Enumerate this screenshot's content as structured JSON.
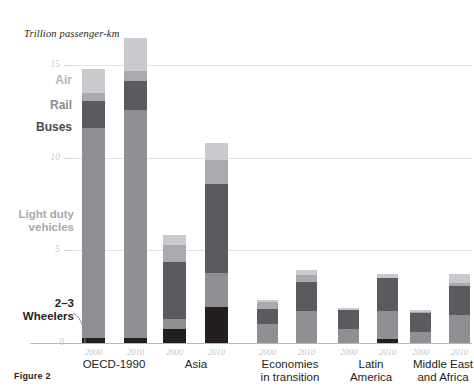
{
  "figure": {
    "caption": "Figure 2",
    "top_cut_text": "",
    "axis_title": "Trillion passenger-km"
  },
  "colors": {
    "wheelers": "#231f20",
    "light_duty_vehicles": "#8f9094",
    "buses": "#5a5b5f",
    "rail": "#a9aaae",
    "air": "#c9cacd",
    "gridline": "#e2e2e6",
    "baseline": "#b9b9bd",
    "tick_text": "#c9c9cc",
    "label_text": "#231f20"
  },
  "legend": {
    "items": [
      {
        "key": "air",
        "label": "Air"
      },
      {
        "key": "rail",
        "label": "Rail"
      },
      {
        "key": "buses",
        "label": "Buses"
      },
      {
        "key": "light_duty_vehicles",
        "label": "Light duty\nvehicles"
      },
      {
        "key": "wheelers",
        "label": "2–3\nWheelers"
      }
    ],
    "air_label": "Air",
    "rail_label": "Rail",
    "buses_label": "Buses",
    "ldv_line1": "Light duty",
    "ldv_line2": "vehicles",
    "wheelers_line1": "2–3",
    "wheelers_line2": "Wheelers"
  },
  "chart_data": {
    "type": "bar",
    "title": "",
    "subtitle": "",
    "xlabel": "",
    "ylabel": "Trillion passenger-km",
    "ylim": [
      0,
      16.5
    ],
    "yticks": [
      0,
      5,
      10,
      15
    ],
    "ytick_labels": [
      "0",
      "5",
      "10",
      "15"
    ],
    "grid": true,
    "stacked": true,
    "legend_position": "left-inline",
    "categories": [
      "OECD-1990",
      "Asia",
      "Economies in transition",
      "Latin America",
      "Middle East and Africa"
    ],
    "category_labels": [
      [
        "OECD-1990"
      ],
      [
        "Asia"
      ],
      [
        "Economies",
        "in transition"
      ],
      [
        "Latin",
        "America"
      ],
      [
        "Middle East",
        "and Africa"
      ]
    ],
    "years": [
      "2000",
      "2010"
    ],
    "series": [
      {
        "name": "2–3 Wheelers",
        "color": "#231f20",
        "values": [
          {
            "group": "OECD-1990",
            "2000": 0.25,
            "2010": 0.25
          },
          {
            "group": "Asia",
            "2000": 0.75,
            "2010": 1.95
          },
          {
            "group": "Economies in transition",
            "2000": 0.0,
            "2010": 0.0
          },
          {
            "group": "Latin America",
            "2000": 0.0,
            "2010": 0.2
          },
          {
            "group": "Middle East and Africa",
            "2000": 0.0,
            "2010": 0.0
          }
        ]
      },
      {
        "name": "Light duty vehicles",
        "color": "#8f9094",
        "values": [
          {
            "group": "OECD-1990",
            "2000": 11.35,
            "2010": 12.3
          },
          {
            "group": "Asia",
            "2000": 0.55,
            "2010": 1.85
          },
          {
            "group": "Economies in transition",
            "2000": 1.0,
            "2010": 1.75
          },
          {
            "group": "Latin America",
            "2000": 0.75,
            "2010": 1.55
          },
          {
            "group": "Middle East and Africa",
            "2000": 0.6,
            "2010": 1.5
          }
        ]
      },
      {
        "name": "Buses",
        "color": "#5a5b5f",
        "values": [
          {
            "group": "OECD-1990",
            "2000": 1.45,
            "2010": 1.6
          },
          {
            "group": "Asia",
            "2000": 3.05,
            "2010": 4.8
          },
          {
            "group": "Economies in transition",
            "2000": 0.85,
            "2010": 1.55
          },
          {
            "group": "Latin America",
            "2000": 1.05,
            "2010": 1.75
          },
          {
            "group": "Middle East and Africa",
            "2000": 1.0,
            "2010": 1.55
          }
        ]
      },
      {
        "name": "Rail",
        "color": "#a9aaae",
        "values": [
          {
            "group": "OECD-1990",
            "2000": 0.45,
            "2010": 0.55
          },
          {
            "group": "Asia",
            "2000": 0.95,
            "2010": 1.25
          },
          {
            "group": "Economies in transition",
            "2000": 0.35,
            "2010": 0.35
          },
          {
            "group": "Latin America",
            "2000": 0.0,
            "2010": 0.0
          },
          {
            "group": "Middle East and Africa",
            "2000": 0.1,
            "2010": 0.2
          }
        ]
      },
      {
        "name": "Air",
        "color": "#c9cacd",
        "values": [
          {
            "group": "OECD-1990",
            "2000": 1.3,
            "2010": 1.75
          },
          {
            "group": "Asia",
            "2000": 0.55,
            "2010": 0.95
          },
          {
            "group": "Economies in transition",
            "2000": 0.1,
            "2010": 0.3
          },
          {
            "group": "Latin America",
            "2000": 0.1,
            "2010": 0.25
          },
          {
            "group": "Middle East and Africa",
            "2000": 0.1,
            "2010": 0.45
          }
        ]
      }
    ],
    "totals": {
      "OECD-1990": {
        "2000": 14.8,
        "2010": 16.45
      },
      "Asia": {
        "2000": 5.85,
        "2010": 10.8
      },
      "Economies in transition": {
        "2000": 2.3,
        "2010": 3.95
      },
      "Latin America": {
        "2000": 1.9,
        "2010": 3.75
      },
      "Middle East and Africa": {
        "2000": 1.8,
        "2010": 3.7
      }
    }
  }
}
